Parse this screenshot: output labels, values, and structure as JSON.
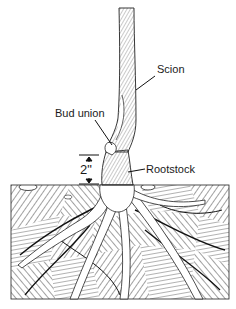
{
  "diagram": {
    "labels": {
      "scion": "Scion",
      "bud_union": "Bud union",
      "rootstock": "Rootstock",
      "height_measure": "2\""
    },
    "colors": {
      "ink": "#1a1a1a",
      "background": "#ffffff",
      "soil_hatch": "#555555"
    }
  }
}
